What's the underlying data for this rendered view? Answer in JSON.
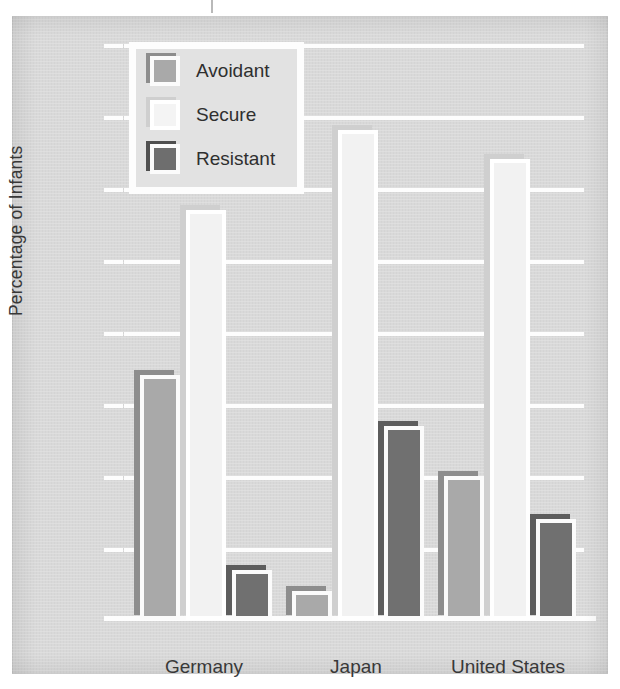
{
  "chart_data": {
    "type": "bar",
    "title": "",
    "xlabel": "",
    "ylabel": "Percentage of Infants",
    "categories": [
      "Germany",
      "Japan",
      "United States"
    ],
    "series": [
      {
        "name": "Avoidant",
        "values": [
          34,
          4,
          20
        ],
        "color": "#a9a9a9"
      },
      {
        "name": "Secure",
        "values": [
          57,
          68,
          64
        ],
        "color": "#f2f2f2"
      },
      {
        "name": "Resistant",
        "values": [
          7,
          27,
          14
        ],
        "color": "#707070"
      }
    ],
    "ylim": [
      0,
      80
    ],
    "ytick_step": 10,
    "ytick_labels": [
      "80",
      "70",
      "60",
      "50",
      "40",
      "30",
      "20",
      "10",
      "0"
    ],
    "grid": true,
    "legend_position": "top-left"
  },
  "legend": {
    "entries": [
      {
        "label": "Avoidant",
        "swatch": "avoidant-swatch"
      },
      {
        "label": "Secure",
        "swatch": "secure-swatch"
      },
      {
        "label": "Resistant",
        "swatch": "resistant-swatch"
      }
    ]
  },
  "colors": {
    "panel_background": "#d9d9d9",
    "gridline": "#fdfdfd",
    "text": "#3a3a3a",
    "avoidant": "#a9a9a9",
    "secure": "#f2f2f2",
    "resistant": "#707070"
  }
}
